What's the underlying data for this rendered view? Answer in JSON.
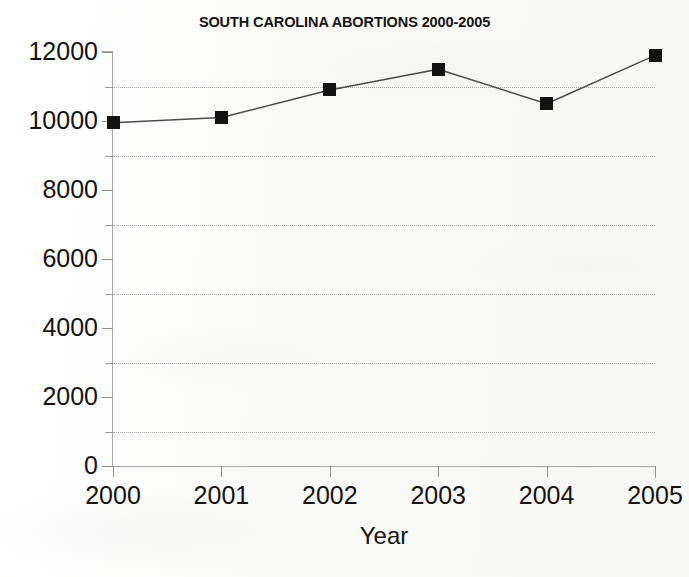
{
  "chart_data": {
    "type": "line",
    "title": "SOUTH CAROLINA ABORTIONS 2000-2005",
    "xlabel": "Year",
    "ylabel": "",
    "categories": [
      "2000",
      "2001",
      "2002",
      "2003",
      "2004",
      "2005"
    ],
    "x": [
      2000,
      2001,
      2002,
      2003,
      2004,
      2005
    ],
    "values": [
      9950,
      10100,
      10900,
      11500,
      10500,
      11900
    ],
    "series": [
      {
        "name": "South Carolina abortions",
        "values": [
          9950,
          10100,
          10900,
          11500,
          10500,
          11900
        ]
      }
    ],
    "ylim": [
      0,
      12000
    ],
    "xlim": [
      2000,
      2005
    ],
    "y_ticks": [
      0,
      2000,
      4000,
      6000,
      8000,
      10000,
      12000
    ],
    "y_tick_labels": [
      "0",
      "2000",
      "4000",
      "6000",
      "8000",
      "10000",
      "12000"
    ],
    "y_minor_ticks": [
      1000,
      3000,
      5000,
      7000,
      9000,
      11000
    ],
    "gridlines": {
      "horizontal": true,
      "vertical": false,
      "style": "dotted",
      "at_values": [
        1000,
        3000,
        5000,
        7000,
        9000,
        11000
      ]
    },
    "legend": null,
    "legend_position": "none",
    "marker": "square",
    "marker_color": "#121212",
    "line_color": "#4a4a4a",
    "background_color": "#fbfbfa",
    "axis_color": "#a8a8a8",
    "text_color": "#131313"
  },
  "chart": {
    "title": "SOUTH CAROLINA ABORTIONS 2000-2005",
    "x_axis_title": "Year",
    "y_tick_labels": [
      "12000",
      "10000",
      "8000",
      "6000",
      "4000",
      "2000",
      "0"
    ],
    "x_tick_labels": [
      "2000",
      "2001",
      "2002",
      "2003",
      "2004",
      "2005"
    ]
  }
}
